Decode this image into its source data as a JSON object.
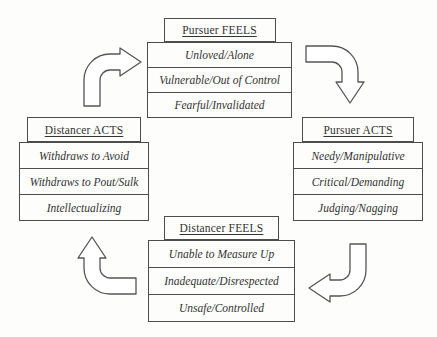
{
  "diagram": {
    "colors": {
      "background": "#fdfdfb",
      "border": "#4d4d4d",
      "text": "#333333",
      "arrow_stroke": "#555555",
      "arrow_fill": "#ffffff"
    },
    "nodes": {
      "pursuer_feels": {
        "title": "Pursuer FEELS",
        "items": [
          "Unloved/Alone",
          "Vulnerable/Out of Control",
          "Fearful/Invalidated"
        ]
      },
      "pursuer_acts": {
        "title": "Pursuer ACTS",
        "items": [
          "Needy/Manipulative",
          "Critical/Demanding",
          "Judging/Nagging"
        ]
      },
      "distancer_feels": {
        "title": "Distancer FEELS",
        "items": [
          "Unable to Measure Up",
          "Inadequate/Disrespected",
          "Unsafe/Controlled"
        ]
      },
      "distancer_acts": {
        "title": "Distancer ACTS",
        "items": [
          "Withdraws to Avoid",
          "Withdraws to Pout/Sulk",
          "Intellectualizing"
        ]
      }
    },
    "arrows": [
      {
        "from": "Pursuer FEELS",
        "to": "Pursuer ACTS",
        "points": "down"
      },
      {
        "from": "Pursuer ACTS",
        "to": "Distancer FEELS",
        "points": "left"
      },
      {
        "from": "Distancer FEELS",
        "to": "Distancer ACTS",
        "points": "up"
      },
      {
        "from": "Distancer ACTS",
        "to": "Pursuer FEELS",
        "points": "right"
      }
    ]
  }
}
